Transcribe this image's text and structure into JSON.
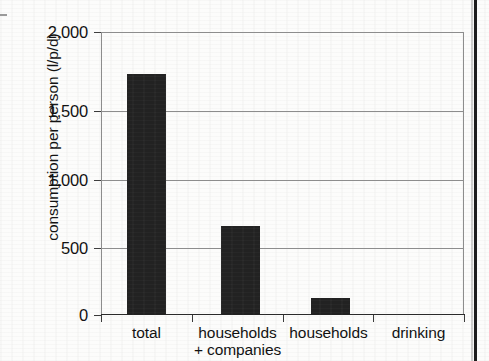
{
  "chart_data": {
    "type": "bar",
    "title": "",
    "subtitle": "",
    "xlabel": "",
    "ylabel": "consumption per person (l/p/d)",
    "categories": [
      "total",
      "households + companies",
      "households",
      "drinking"
    ],
    "category_lines": [
      [
        "total"
      ],
      [
        "households",
        "+ companies"
      ],
      [
        "households"
      ],
      [
        "drinking"
      ]
    ],
    "values": [
      1700,
      630,
      120,
      3
    ],
    "ylim": [
      0,
      2000
    ],
    "y_ticks": [
      0,
      500,
      1000,
      1500,
      2000
    ],
    "y_tick_labels": [
      "0",
      "500",
      "1,000",
      "1,500",
      "2,000"
    ],
    "grid": "horizontal",
    "legend": "none",
    "bar_color": "#222222",
    "axis_color": "#8d8d8d",
    "background_color": "#fcfcfb",
    "series": [
      {
        "name": "consumption per person",
        "values": [
          1700,
          630,
          120,
          3
        ]
      }
    ]
  },
  "figure": {
    "y_axis_title": "consumption per person (l/p/d)"
  }
}
